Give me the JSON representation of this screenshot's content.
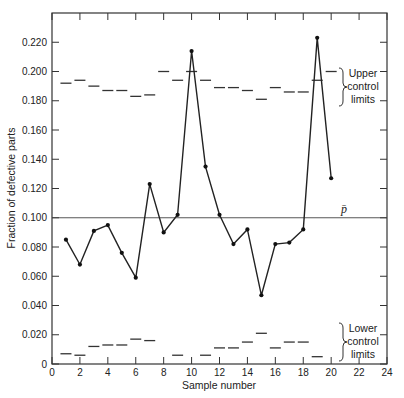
{
  "chart_data": {
    "type": "line",
    "title": "",
    "xlabel": "Sample number",
    "ylabel": "Fraction of defective parts",
    "xlim": [
      0,
      24
    ],
    "ylim": [
      0,
      0.24
    ],
    "xticks": [
      0,
      2,
      4,
      6,
      8,
      10,
      12,
      14,
      16,
      18,
      20,
      22,
      24
    ],
    "yticks": [
      0,
      0.02,
      0.04,
      0.06,
      0.08,
      0.1,
      0.12,
      0.14,
      0.16,
      0.18,
      0.2,
      0.22
    ],
    "ytick_labels": [
      "0",
      "0.020",
      "0.040",
      "0.060",
      "0.080",
      "0.100",
      "0.120",
      "0.140",
      "0.160",
      "0.180",
      "0.200",
      "0.220"
    ],
    "grid": false,
    "x": [
      1,
      2,
      3,
      4,
      5,
      6,
      7,
      8,
      9,
      10,
      11,
      12,
      13,
      14,
      15,
      16,
      17,
      18,
      19,
      20
    ],
    "series": [
      {
        "name": "Fraction defective",
        "values": [
          0.085,
          0.068,
          0.091,
          0.095,
          0.076,
          0.059,
          0.123,
          0.09,
          0.102,
          0.214,
          0.135,
          0.102,
          0.082,
          0.092,
          0.047,
          0.082,
          0.083,
          0.092,
          0.223,
          0.127
        ]
      },
      {
        "name": "Upper control limits",
        "values": [
          0.192,
          0.194,
          0.19,
          0.187,
          0.187,
          0.183,
          0.184,
          0.2,
          0.194,
          0.2,
          0.194,
          0.189,
          0.189,
          0.187,
          0.181,
          0.189,
          0.186,
          0.186,
          0.194,
          0.2
        ]
      },
      {
        "name": "Lower control limits",
        "values": [
          0.007,
          0.006,
          0.012,
          0.013,
          0.013,
          0.017,
          0.016,
          null,
          0.006,
          null,
          0.006,
          0.011,
          0.011,
          0.015,
          0.021,
          0.011,
          0.015,
          0.015,
          0.005,
          null
        ]
      }
    ],
    "center_line": {
      "label": "p̄",
      "value": 0.1
    },
    "annotations": [
      {
        "text": [
          "Upper",
          "control",
          "limits"
        ],
        "target": "Upper control limits"
      },
      {
        "text": [
          "Lower",
          "control",
          "limits"
        ],
        "target": "Lower control limits"
      }
    ]
  }
}
